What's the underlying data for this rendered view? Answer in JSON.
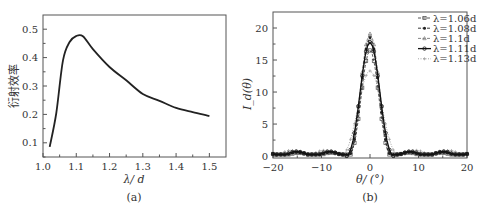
{
  "chart_data": [
    {
      "id": "a",
      "type": "line",
      "caption": "(a)",
      "title": "",
      "xlabel": "λ/ d",
      "ylabel": "衍射效率",
      "xlim": [
        1.0,
        1.55
      ],
      "ylim": [
        0.05,
        0.55
      ],
      "xticks": [
        1.0,
        1.1,
        1.2,
        1.3,
        1.4,
        1.5
      ],
      "xtick_labels": [
        "1.0",
        "1.1",
        "1.2",
        "1.3",
        "1.4",
        "1.5"
      ],
      "yticks": [
        0.1,
        0.2,
        0.3,
        0.4,
        0.5
      ],
      "ytick_labels": [
        "0.1",
        "0.2",
        "0.3",
        "0.4",
        "0.5"
      ],
      "grid": false,
      "series": [
        {
          "name": "diffraction efficiency",
          "x": [
            1.02,
            1.04,
            1.06,
            1.08,
            1.1,
            1.12,
            1.15,
            1.2,
            1.25,
            1.3,
            1.35,
            1.4,
            1.45,
            1.5
          ],
          "y": [
            0.086,
            0.205,
            0.39,
            0.455,
            0.476,
            0.475,
            0.43,
            0.367,
            0.32,
            0.272,
            0.248,
            0.223,
            0.208,
            0.194
          ]
        }
      ]
    },
    {
      "id": "b",
      "type": "line",
      "caption": "(b)",
      "title": "",
      "xlabel": "θ/ (°)",
      "ylabel": "I_d(θ)",
      "xlim": [
        -20,
        20
      ],
      "ylim": [
        -0.3,
        22.5
      ],
      "xticks": [
        -20,
        -10,
        0,
        10,
        20
      ],
      "xtick_labels": [
        "−20",
        "−10",
        "0",
        "10",
        "20"
      ],
      "yticks": [
        0,
        5,
        10,
        15,
        20
      ],
      "ytick_labels": [
        "0",
        "5",
        "10",
        "15",
        "20"
      ],
      "grid": false,
      "legend_position": "upper right",
      "series": [
        {
          "name": "λ=1.06d",
          "peak": 16.5,
          "halfwidth": 4.5,
          "sidelobe": 0.6,
          "marker": "square-open",
          "line": "dashed",
          "color": "#444444"
        },
        {
          "name": "λ=1.08d",
          "peak": 18.5,
          "halfwidth": 4.6,
          "sidelobe": 0.7,
          "marker": "dot-filled",
          "line": "dashed",
          "color": "#222222"
        },
        {
          "name": "λ=1.1d",
          "peak": 19.1,
          "halfwidth": 4.8,
          "sidelobe": 0.8,
          "marker": "triangle",
          "line": "dashed",
          "color": "#777777"
        },
        {
          "name": "λ=1.11d",
          "peak": 17.8,
          "halfwidth": 5.0,
          "sidelobe": 0.8,
          "marker": "circle-open",
          "line": "solid",
          "color": "#111111"
        },
        {
          "name": "λ=1.13d",
          "peak": 13.3,
          "halfwidth": 6.2,
          "sidelobe": 1.0,
          "marker": "plus",
          "line": "dotted",
          "color": "#999999"
        }
      ],
      "legend": [
        "λ=1.06d",
        "λ=1.08d",
        "λ=1.1d",
        "λ=1.11d",
        "λ=1.13d"
      ]
    }
  ]
}
